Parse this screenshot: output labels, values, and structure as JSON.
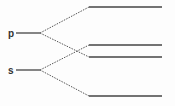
{
  "diagram": {
    "type": "energy-level-splitting",
    "labels": {
      "p": "p",
      "s": "s"
    },
    "levels_left": [
      {
        "name": "p",
        "y": 33
      },
      {
        "name": "s",
        "y": 70
      }
    ],
    "levels_right": [
      {
        "y": 7
      },
      {
        "y": 45
      },
      {
        "y": 57
      },
      {
        "y": 96
      }
    ],
    "connections": [
      {
        "from": "p",
        "to": 0
      },
      {
        "from": "p",
        "to": 2
      },
      {
        "from": "s",
        "to": 1
      },
      {
        "from": "s",
        "to": 3
      }
    ],
    "colors": {
      "line": "#444444",
      "background": "#fdfdfd"
    }
  }
}
